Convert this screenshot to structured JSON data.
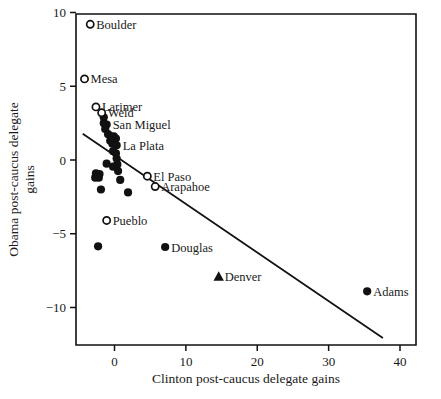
{
  "chart_data": {
    "type": "scatter",
    "title": "",
    "xlabel": "Clinton post-caucus delegate gains",
    "ylabel": "Obama post-caucus delegate gains",
    "xlim": [
      -5.3,
      41.0
    ],
    "ylim": [
      -12.5,
      10.8
    ],
    "xticks": [
      0,
      10,
      20,
      30,
      40
    ],
    "xticklabels": [
      "0",
      "10",
      "20",
      "30",
      "40"
    ],
    "yticks": [
      10,
      5,
      0,
      -5,
      -10
    ],
    "yticklabels": [
      "10",
      "5",
      "0",
      "-5",
      "-10"
    ],
    "grid": false,
    "legend": "none",
    "marker_types": {
      "open": "open-circle",
      "filled": "filled-circle",
      "triangle": "filled-triangle"
    },
    "labeled_points": [
      {
        "label": "Boulder",
        "x": -3.4,
        "y": 9.2,
        "marker": "open",
        "label_side": "right"
      },
      {
        "label": "Mesa",
        "x": -4.2,
        "y": 5.5,
        "marker": "open",
        "label_side": "right"
      },
      {
        "label": "Larimer",
        "x": -2.6,
        "y": 3.6,
        "marker": "open",
        "label_side": "right"
      },
      {
        "label": "Weld",
        "x": -1.8,
        "y": 3.2,
        "marker": "open",
        "label_side": "right"
      },
      {
        "label": "San Miguel",
        "x": -1.1,
        "y": 2.4,
        "marker": "filled",
        "label_side": "right"
      },
      {
        "label": "La Plata",
        "x": 0.3,
        "y": 1.0,
        "marker": "filled",
        "label_side": "right"
      },
      {
        "label": "El Paso",
        "x": 4.6,
        "y": -1.1,
        "marker": "open",
        "label_side": "right"
      },
      {
        "label": "Arapahoe",
        "x": 5.7,
        "y": -1.8,
        "marker": "open",
        "label_side": "right"
      },
      {
        "label": "Pueblo",
        "x": -1.1,
        "y": -4.1,
        "marker": "open",
        "label_side": "right"
      },
      {
        "label": "Douglas",
        "x": 7.1,
        "y": -5.9,
        "marker": "filled",
        "label_side": "right"
      },
      {
        "label": "Denver",
        "x": 14.6,
        "y": -7.9,
        "marker": "triangle",
        "label_side": "right"
      },
      {
        "label": "Adams",
        "x": 35.4,
        "y": -8.9,
        "marker": "filled",
        "label_side": "right"
      }
    ],
    "unlabeled_points": [
      {
        "x": -1.5,
        "y": 2.9,
        "marker": "filled"
      },
      {
        "x": -1.5,
        "y": 2.5,
        "marker": "filled"
      },
      {
        "x": -1.3,
        "y": 2.1,
        "marker": "filled"
      },
      {
        "x": -0.9,
        "y": 1.75,
        "marker": "filled"
      },
      {
        "x": -0.5,
        "y": 1.6,
        "marker": "filled"
      },
      {
        "x": -0.1,
        "y": 1.6,
        "marker": "filled"
      },
      {
        "x": 0.2,
        "y": 1.45,
        "marker": "filled"
      },
      {
        "x": -0.6,
        "y": 1.3,
        "marker": "filled"
      },
      {
        "x": -0.3,
        "y": 1.1,
        "marker": "filled"
      },
      {
        "x": -0.2,
        "y": 0.6,
        "marker": "filled"
      },
      {
        "x": 0.2,
        "y": 0.45,
        "marker": "filled"
      },
      {
        "x": 0.3,
        "y": 0.1,
        "marker": "filled"
      },
      {
        "x": -1.1,
        "y": -0.25,
        "marker": "filled"
      },
      {
        "x": 0.4,
        "y": -0.3,
        "marker": "filled"
      },
      {
        "x": -0.2,
        "y": -0.45,
        "marker": "filled"
      },
      {
        "x": 0.5,
        "y": -0.75,
        "marker": "filled"
      },
      {
        "x": -2.6,
        "y": -0.9,
        "marker": "filled"
      },
      {
        "x": -2.1,
        "y": -0.95,
        "marker": "filled"
      },
      {
        "x": -2.7,
        "y": -1.2,
        "marker": "filled"
      },
      {
        "x": -2.2,
        "y": -1.2,
        "marker": "filled"
      },
      {
        "x": 0.8,
        "y": -1.35,
        "marker": "filled"
      },
      {
        "x": -1.9,
        "y": -2.0,
        "marker": "filled"
      },
      {
        "x": 1.9,
        "y": -2.2,
        "marker": "filled"
      },
      {
        "x": -2.3,
        "y": -5.85,
        "marker": "filled"
      }
    ],
    "fit_line": {
      "x_start": -4.45,
      "y_start": 1.78,
      "x_end": 37.6,
      "y_end": -12.07
    }
  }
}
